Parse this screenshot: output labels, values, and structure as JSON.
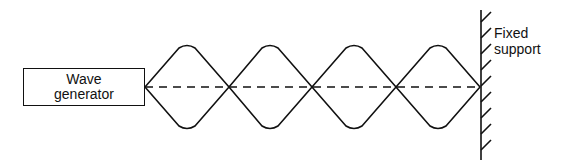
{
  "diagram": {
    "type": "standing-wave",
    "generator": {
      "line1": "Wave",
      "line2": "generator"
    },
    "support": {
      "line1": "Fixed",
      "line2": "support"
    },
    "loops": 4,
    "nodes_x": [
      145,
      229,
      312,
      396,
      480
    ],
    "centerline_y": 87,
    "amplitude_px": 44,
    "colors": {
      "stroke": "#111111",
      "background": "#ffffff"
    }
  }
}
